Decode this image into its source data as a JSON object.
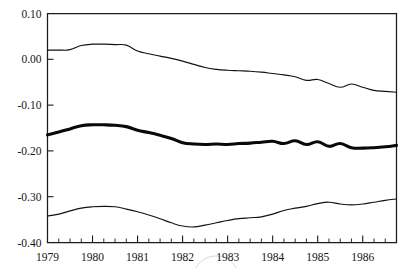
{
  "chart_data": {
    "type": "line",
    "title": "",
    "subtitle": "",
    "xlabel": "",
    "ylabel": "",
    "xlim": [
      1979.0,
      1986.75
    ],
    "ylim": [
      -0.4,
      0.1
    ],
    "grid": false,
    "legend": "none",
    "y_ticks": [
      0.1,
      0.0,
      -0.1,
      -0.2,
      -0.3,
      -0.4
    ],
    "y_tick_labels": [
      "0.10",
      "0.00",
      "-0.10",
      "-0.20",
      "-0.30",
      "-0.40"
    ],
    "x_ticks": [
      1979,
      1980,
      1981,
      1982,
      1983,
      1984,
      1985,
      1986
    ],
    "x_tick_labels": [
      "1979",
      "1980",
      "1981",
      "1982",
      "1983",
      "1984",
      "1985",
      "1986"
    ],
    "x_minor_ticks_per_interval": 3,
    "series": [
      {
        "name": "upper-band",
        "style": "thin",
        "color": "#121212",
        "x": [
          1979.0,
          1979.25,
          1979.5,
          1979.75,
          1980.0,
          1980.25,
          1980.5,
          1980.75,
          1981.0,
          1981.25,
          1981.5,
          1981.75,
          1982.0,
          1982.25,
          1982.5,
          1982.75,
          1983.0,
          1983.25,
          1983.5,
          1983.75,
          1984.0,
          1984.25,
          1984.5,
          1984.75,
          1985.0,
          1985.25,
          1985.5,
          1985.75,
          1986.0,
          1986.25,
          1986.5,
          1986.75
        ],
        "values": [
          0.02,
          0.02,
          0.021,
          0.03,
          0.033,
          0.033,
          0.032,
          0.031,
          0.018,
          0.012,
          0.007,
          0.002,
          -0.004,
          -0.011,
          -0.018,
          -0.022,
          -0.024,
          -0.025,
          -0.026,
          -0.028,
          -0.031,
          -0.034,
          -0.038,
          -0.046,
          -0.044,
          -0.053,
          -0.061,
          -0.054,
          -0.061,
          -0.068,
          -0.07,
          -0.072
        ]
      },
      {
        "name": "central-estimate",
        "style": "thick",
        "color": "#090909",
        "x": [
          1979.0,
          1979.25,
          1979.5,
          1979.75,
          1980.0,
          1980.25,
          1980.5,
          1980.75,
          1981.0,
          1981.25,
          1981.5,
          1981.75,
          1982.0,
          1982.25,
          1982.5,
          1982.75,
          1983.0,
          1983.25,
          1983.5,
          1983.75,
          1984.0,
          1984.25,
          1984.5,
          1984.75,
          1985.0,
          1985.25,
          1985.5,
          1985.75,
          1986.0,
          1986.25,
          1986.5,
          1986.75
        ],
        "values": [
          -0.165,
          -0.159,
          -0.152,
          -0.145,
          -0.143,
          -0.143,
          -0.144,
          -0.147,
          -0.155,
          -0.16,
          -0.166,
          -0.173,
          -0.182,
          -0.185,
          -0.186,
          -0.185,
          -0.186,
          -0.184,
          -0.183,
          -0.181,
          -0.179,
          -0.184,
          -0.178,
          -0.186,
          -0.18,
          -0.19,
          -0.184,
          -0.193,
          -0.194,
          -0.193,
          -0.191,
          -0.188
        ]
      },
      {
        "name": "lower-band",
        "style": "thin",
        "color": "#121212",
        "x": [
          1979.0,
          1979.25,
          1979.5,
          1979.75,
          1980.0,
          1980.25,
          1980.5,
          1980.75,
          1981.0,
          1981.25,
          1981.5,
          1981.75,
          1982.0,
          1982.25,
          1982.5,
          1982.75,
          1983.0,
          1983.25,
          1983.5,
          1983.75,
          1984.0,
          1984.25,
          1984.5,
          1984.75,
          1985.0,
          1985.25,
          1985.5,
          1985.75,
          1986.0,
          1986.25,
          1986.5,
          1986.75
        ],
        "values": [
          -0.342,
          -0.338,
          -0.331,
          -0.325,
          -0.322,
          -0.321,
          -0.322,
          -0.327,
          -0.333,
          -0.34,
          -0.348,
          -0.357,
          -0.364,
          -0.366,
          -0.362,
          -0.357,
          -0.352,
          -0.348,
          -0.346,
          -0.344,
          -0.338,
          -0.33,
          -0.325,
          -0.321,
          -0.315,
          -0.312,
          -0.316,
          -0.318,
          -0.316,
          -0.312,
          -0.308,
          -0.305
        ]
      }
    ]
  }
}
